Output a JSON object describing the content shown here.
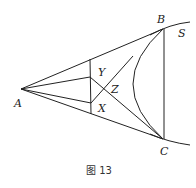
{
  "figure": {
    "caption": "图 13",
    "labels": {
      "A": "A",
      "B": "B",
      "S": "S",
      "C": "C",
      "X": "X",
      "Y": "Y",
      "Z": "Z"
    }
  }
}
